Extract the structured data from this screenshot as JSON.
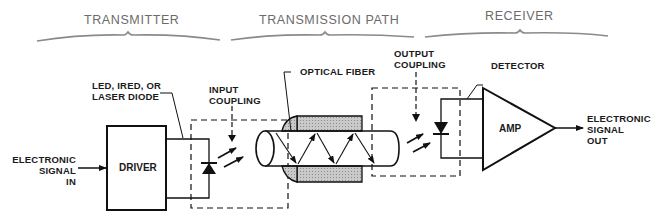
{
  "sections": {
    "transmitter": "TRANSMITTER",
    "transmission_path": "TRANSMISSION PATH",
    "receiver": "RECEIVER"
  },
  "labels": {
    "input_signal": [
      "ELECTRONIC",
      "SIGNAL",
      "IN"
    ],
    "driver": "DRIVER",
    "source": [
      "LED, IRED, OR",
      "LASER DIODE"
    ],
    "input_coupling": [
      "INPUT",
      "COUPLING"
    ],
    "optical_fiber": "OPTICAL FIBER",
    "output_coupling": [
      "OUTPUT",
      "COUPLING"
    ],
    "detector": "DETECTOR",
    "amp": "AMP",
    "output_signal": [
      "ELECTRONIC",
      "SIGNAL",
      "OUT"
    ]
  },
  "colors": {
    "line": "#111111",
    "header_text": "#6b6b6b",
    "brace": "#8a8a8a",
    "collar_fill": "#c8c8c8"
  }
}
